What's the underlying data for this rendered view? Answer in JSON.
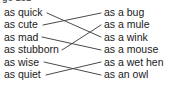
{
  "worksheet": {
    "clipped_heading": "ge 151",
    "left_column": {
      "items": [
        {
          "id": "quick",
          "label": "as quick"
        },
        {
          "id": "cute",
          "label": "as cute"
        },
        {
          "id": "mad",
          "label": "as mad"
        },
        {
          "id": "stubborn",
          "label": "as stubborn"
        },
        {
          "id": "wise",
          "label": "as wise"
        },
        {
          "id": "quiet",
          "label": "as quiet"
        }
      ]
    },
    "right_column": {
      "items": [
        {
          "id": "bug",
          "label": "as a bug"
        },
        {
          "id": "mule",
          "label": "as a mule"
        },
        {
          "id": "wink",
          "label": "as a wink"
        },
        {
          "id": "mouse",
          "label": "as a mouse"
        },
        {
          "id": "wet-hen",
          "label": "as a wet hen"
        },
        {
          "id": "owl",
          "label": "as an owl"
        }
      ]
    },
    "connections": [
      {
        "from": "quick",
        "to": "wink",
        "x1": 47,
        "y1": 13,
        "x2": 101,
        "y2": 37
      },
      {
        "from": "cute",
        "to": "bug",
        "x1": 43,
        "y1": 25,
        "x2": 101,
        "y2": 13
      },
      {
        "from": "mad",
        "to": "mouse",
        "x1": 42,
        "y1": 37,
        "x2": 101,
        "y2": 50
      },
      {
        "from": "stubborn",
        "to": "mule",
        "x1": 62,
        "y1": 50,
        "x2": 101,
        "y2": 25
      },
      {
        "from": "wise",
        "to": "owl",
        "x1": 44,
        "y1": 62,
        "x2": 101,
        "y2": 75
      },
      {
        "from": "quiet",
        "to": "wet-hen",
        "x1": 46,
        "y1": 75,
        "x2": 101,
        "y2": 62
      }
    ],
    "colors": {
      "text": "#1a1a1a",
      "line": "#4a4a4a",
      "background": "#ffffff"
    }
  }
}
